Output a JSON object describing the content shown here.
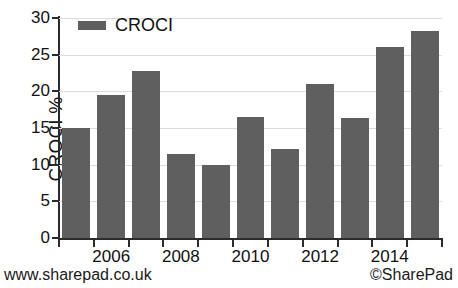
{
  "chart_data": {
    "type": "bar",
    "title": "",
    "subtitle": "",
    "xlabel": "",
    "ylabel": "CROCI %",
    "ylim": [
      0,
      30
    ],
    "ytick_values": [
      0,
      5,
      10,
      15,
      20,
      25,
      30
    ],
    "ytick_labels": [
      "0",
      "5",
      "10",
      "15",
      "20",
      "25",
      "30"
    ],
    "grid": true,
    "grid_axis": "y",
    "legend": [
      {
        "name": "CROCI",
        "color": "#5f5f5f"
      }
    ],
    "legend_position": "top-left-inside",
    "categories": [
      "2005",
      "2006",
      "2007",
      "2008",
      "2009",
      "2010",
      "2011",
      "2012",
      "2013",
      "2014",
      "2015"
    ],
    "xtick_labels": [
      "",
      "2006",
      "",
      "2008",
      "",
      "2010",
      "",
      "2012",
      "",
      "2014",
      ""
    ],
    "series": [
      {
        "name": "CROCI",
        "color": "#5f5f5f",
        "values": [
          15.0,
          19.5,
          22.8,
          11.4,
          10.0,
          16.5,
          12.1,
          21.0,
          16.3,
          26.0,
          28.2
        ]
      }
    ]
  },
  "footer": {
    "left": "www.sharepad.co.uk",
    "right": "©SharePad"
  }
}
